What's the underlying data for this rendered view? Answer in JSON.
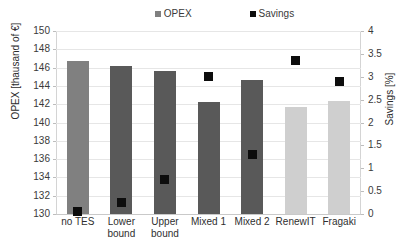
{
  "chart_data": {
    "type": "bar",
    "title": "",
    "subtitle": "",
    "xlabel": "",
    "ylabel": "OPEX [thausand of €]",
    "y2label": "Savings [%]",
    "categories": [
      "no TES",
      "Lower bound",
      "Upper bound",
      "Mixed 1",
      "Mixed 2",
      "RenewIT",
      "Fragaki"
    ],
    "series": [
      {
        "name": "OPEX",
        "type": "bar",
        "axis": "left",
        "unit": "thousand of €",
        "values": [
          146.7,
          146.2,
          145.65,
          142.25,
          144.7,
          141.7,
          142.3
        ],
        "colors": [
          "#808080",
          "#595959",
          "#595959",
          "#595959",
          "#595959",
          "#cfcfcf",
          "#cfcfcf"
        ]
      },
      {
        "name": "Savings",
        "type": "scatter",
        "axis": "right",
        "unit": "%",
        "values": [
          0.05,
          0.25,
          0.75,
          3.0,
          1.3,
          3.35,
          2.9
        ],
        "color": "#0d0d0d"
      }
    ],
    "ylim": [
      130,
      150
    ],
    "ytick_step": 2,
    "yticks": [
      150,
      148,
      146,
      144,
      142,
      140,
      138,
      136,
      134,
      132,
      130
    ],
    "y2lim": [
      0,
      4
    ],
    "y2tick_step": 0.5,
    "y2ticks": [
      "4",
      "3.5",
      "3",
      "2.5",
      "2",
      "1.5",
      "1",
      "0.5",
      "0"
    ],
    "grid": true,
    "grid_axis": "y",
    "legend_position": "top",
    "legend": [
      {
        "label": "OPEX",
        "color": "#808080",
        "marker": "square"
      },
      {
        "label": "Savings",
        "color": "#0d0d0d",
        "marker": "square"
      }
    ]
  }
}
